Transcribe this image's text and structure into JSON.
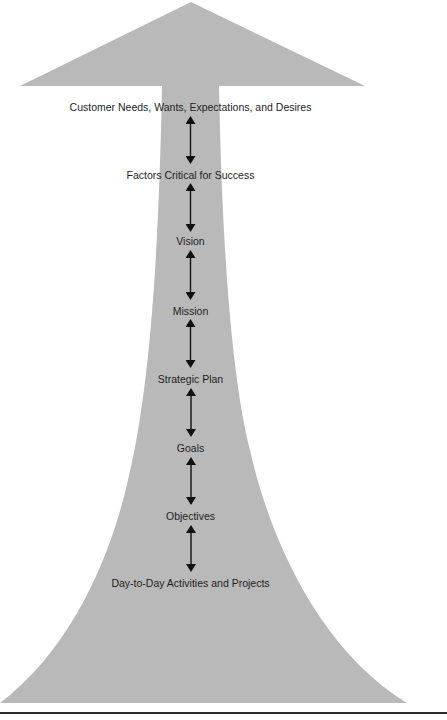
{
  "diagram": {
    "title": "",
    "shape_color": "#b9b9b9",
    "arrow_color": "#111111",
    "levels": [
      {
        "label": "Customer Needs, Wants, Expectations, and Desires",
        "y": 107
      },
      {
        "label": "Factors Critical for Success",
        "y": 175
      },
      {
        "label": "Vision",
        "y": 241
      },
      {
        "label": "Mission",
        "y": 311
      },
      {
        "label": "Strategic Plan",
        "y": 379
      },
      {
        "label": "Goals",
        "y": 448
      },
      {
        "label": "Objectives",
        "y": 516
      },
      {
        "label": "Day-to-Day Activities and Projects",
        "y": 583
      }
    ],
    "connectors": [
      {
        "from": "Customer Needs, Wants, Expectations, and Desires",
        "to": "Factors Critical for Success",
        "type": "bidirectional"
      },
      {
        "from": "Factors Critical for Success",
        "to": "Vision",
        "type": "bidirectional"
      },
      {
        "from": "Vision",
        "to": "Mission",
        "type": "bidirectional"
      },
      {
        "from": "Mission",
        "to": "Strategic Plan",
        "type": "bidirectional"
      },
      {
        "from": "Strategic Plan",
        "to": "Goals",
        "type": "bidirectional"
      },
      {
        "from": "Goals",
        "to": "Objectives",
        "type": "bidirectional"
      },
      {
        "from": "Objectives",
        "to": "Day-to-Day Activities and Projects",
        "type": "bidirectional"
      }
    ]
  }
}
